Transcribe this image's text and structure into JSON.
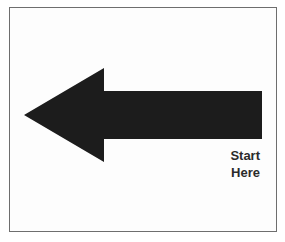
{
  "diagram": {
    "arrow": {
      "direction": "left",
      "color": "#1c1c1c"
    },
    "label": {
      "lines": [
        "Start",
        "Here"
      ],
      "line1": "Start",
      "line2": "Here",
      "color": "#2b2b2b"
    },
    "frame": {
      "border_color": "#6e6e6e",
      "background": "#ffffff"
    }
  }
}
